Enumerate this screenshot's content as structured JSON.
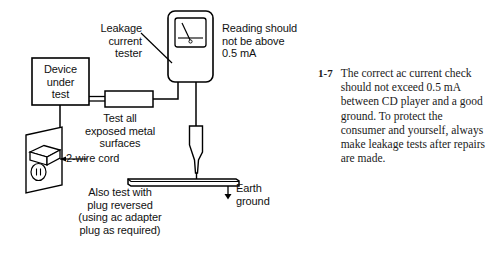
{
  "figure": {
    "labels": {
      "leakage_tester": "Leakage\ncurrent\ntester",
      "reading_note": "Reading should\nnot be above\n0.5 mA",
      "device_under_test": "Device\nunder\ntest",
      "test_all_surfaces": "Test all\nexposed metal\nsurfaces",
      "two_wire_cord": "2-wire cord",
      "plug_reversed_note": "Also test with\nplug reversed\n(using ac adapter\nplug as required)",
      "earth_ground": "Earth\nground"
    },
    "parts": {
      "meter_name": "analog-panel-meter",
      "probe_name": "test-probe",
      "outlet_name": "wall-outlet",
      "plug_name": "two-wire-plug",
      "ground_bar_name": "grounded-metal-bar",
      "connector_name": "inline-connector-block"
    },
    "colors": {
      "ink": "#000000",
      "background": "#ffffff",
      "caption_ink": "#1a1a1a"
    }
  },
  "caption": {
    "number": "1-7",
    "text": "The correct ac current check should not exceed 0.5 mA between CD player and a good ground. To protect the consumer and yourself, always make leakage tests after repairs are made."
  }
}
